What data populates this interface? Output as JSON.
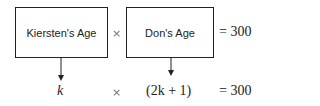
{
  "top_row": {
    "box1_label": "Kiersten's Age",
    "times": "×",
    "box2_label": "Don's Age",
    "equals": "= 300"
  },
  "bottom_row": {
    "term1": "k",
    "times": "×",
    "term2": "(2k + 1)",
    "equals": "= 300"
  }
}
